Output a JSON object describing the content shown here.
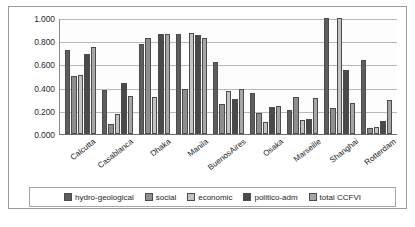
{
  "chart_data": {
    "type": "bar",
    "title": "",
    "xlabel": "",
    "ylabel": "",
    "ylim": [
      0.0,
      1.0
    ],
    "grid": true,
    "legend_position": "bottom",
    "categories": [
      "Calcutta",
      "Casablanca",
      "Dhaka",
      "Manila",
      "BuenosAires",
      "Osaka",
      "Marseille",
      "Shanghai",
      "Rotterdam"
    ],
    "ytick_labels": [
      "1.000",
      "0.800",
      "0.600",
      "0.400",
      "0.200",
      "0.000"
    ],
    "ytick_values": [
      1.0,
      0.8,
      0.6,
      0.4,
      0.2,
      0.0
    ],
    "series": [
      {
        "name": "hydro-geological",
        "color": "#5e5e5e",
        "values": [
          0.72,
          0.38,
          0.78,
          0.86,
          0.62,
          0.35,
          0.21,
          1.0,
          0.64
        ]
      },
      {
        "name": "social",
        "color": "#8e8e8e",
        "values": [
          0.5,
          0.09,
          0.83,
          0.39,
          0.26,
          0.18,
          0.32,
          0.22,
          0.05
        ]
      },
      {
        "name": "economic",
        "color": "#c3c3c3",
        "values": [
          0.51,
          0.17,
          0.32,
          0.87,
          0.37,
          0.1,
          0.12,
          1.0,
          0.06
        ]
      },
      {
        "name": "politico-adm",
        "color": "#4a4a4a",
        "values": [
          0.69,
          0.44,
          0.86,
          0.85,
          0.3,
          0.23,
          0.13,
          0.55,
          0.11
        ]
      },
      {
        "name": "total CCFVI",
        "color": "#a6a6a6",
        "values": [
          0.75,
          0.33,
          0.86,
          0.83,
          0.39,
          0.24,
          0.31,
          0.27,
          0.29
        ]
      }
    ]
  },
  "legend": {
    "items": [
      {
        "label": "hydro-geological"
      },
      {
        "label": "social"
      },
      {
        "label": "economic"
      },
      {
        "label": "politico-adm"
      },
      {
        "label": "total CCFVI"
      }
    ]
  },
  "caption": {
    "text": ""
  }
}
